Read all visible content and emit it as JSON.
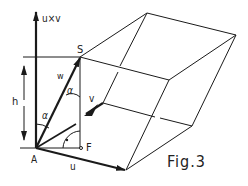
{
  "figure": {
    "caption": "Fig.3",
    "labels": {
      "cross_product": "u×v",
      "S": "S",
      "w": "w",
      "alpha1": "α",
      "alpha2": "α",
      "v": "v",
      "h": "h",
      "A": "A",
      "F": "F",
      "u": "u"
    },
    "colors": {
      "line": "#1a1a1a",
      "background": "#ffffff"
    }
  }
}
